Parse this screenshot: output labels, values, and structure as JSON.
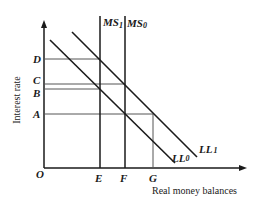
{
  "diagram": {
    "y_axis_label": "Interest rate",
    "x_axis_label": "Real money balances",
    "origin_label": "O",
    "y_ticks": [
      {
        "label": "D",
        "y": 59
      },
      {
        "label": "C",
        "y": 84
      },
      {
        "label": "B",
        "y": 89
      },
      {
        "label": "A",
        "y": 114
      }
    ],
    "x_ticks": [
      {
        "label": "E",
        "x": 100
      },
      {
        "label": "F",
        "x": 125
      },
      {
        "label": "G",
        "x": 153
      }
    ],
    "curves": {
      "ms1": {
        "label": "MS",
        "sub": "1"
      },
      "ms0": {
        "label": "MS",
        "sub": "0"
      },
      "ll0": {
        "label": "LL",
        "sub": "0"
      },
      "ll1": {
        "label": "LL",
        "sub": "1"
      }
    },
    "colors": {
      "line": "#1a1a1a",
      "guide": "#555555"
    }
  }
}
